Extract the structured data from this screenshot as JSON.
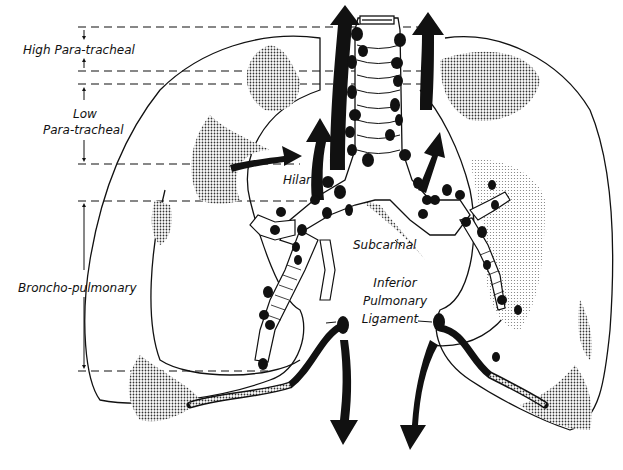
{
  "diagram": {
    "type": "anatomical-illustration",
    "colors": {
      "ink": "#111111",
      "shade": "#555555",
      "background": "#ffffff"
    },
    "zones": [
      {
        "id": "high_para_tracheal",
        "label": "High Para-tracheal",
        "top_y": 27,
        "bottom_y": 71
      },
      {
        "id": "low_para_tracheal",
        "label_line1": "Low",
        "label_line2": "Para-tracheal",
        "top_y": 84,
        "bottom_y": 164
      },
      {
        "id": "broncho_pulmonary",
        "label": "Broncho-pulmonary",
        "top_y": 201,
        "bottom_y": 371
      }
    ],
    "node_labels": {
      "hilar": "Hilar",
      "subcarinal": "Subcarinal",
      "inferior_line1": "Inferior",
      "inferior_line2": "Pulmonary",
      "inferior_line3": "Ligament"
    },
    "arrows": [
      {
        "direction": "up",
        "location": "left of trachea, top"
      },
      {
        "direction": "up",
        "location": "right of trachea, top"
      },
      {
        "direction": "up",
        "location": "left hilar region"
      },
      {
        "direction": "up-right",
        "location": "right main bronchus"
      },
      {
        "direction": "right",
        "location": "left lung upper lobe"
      },
      {
        "direction": "down",
        "location": "left inferior pulmonary ligament"
      },
      {
        "direction": "down",
        "location": "right inferior pulmonary ligament"
      }
    ]
  }
}
